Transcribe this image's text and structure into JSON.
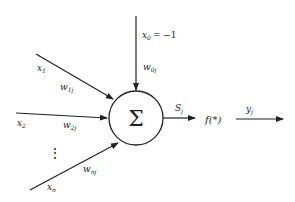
{
  "diagram": {
    "neuron": {
      "symbol": "Σ",
      "label": "summation-node"
    },
    "bias_input": {
      "label": "x",
      "sub": "0",
      "value_text": "= −1",
      "weight": "w",
      "weight_sub": "0j"
    },
    "inputs": [
      {
        "label": "x",
        "sub": "1",
        "weight": "w",
        "weight_sub": "1j"
      },
      {
        "label": "x",
        "sub": "2",
        "weight": "w",
        "weight_sub": "2j"
      },
      {
        "label": "x",
        "sub": "n",
        "weight": "w",
        "weight_sub": "nj"
      }
    ],
    "ellipsis": "⋮",
    "sum_output": {
      "label": "S",
      "sub": "j"
    },
    "activation": {
      "label": "f(*)"
    },
    "output": {
      "label": "y",
      "sub": "j"
    },
    "colors": {
      "stroke": "#222222",
      "background": "#ffffff"
    }
  }
}
